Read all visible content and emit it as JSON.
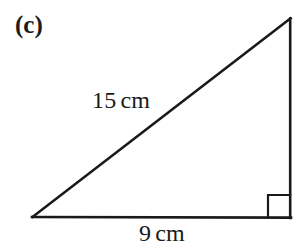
{
  "figure": {
    "part_label": "(c)",
    "background_color": "#ffffff",
    "stroke_color": "#1a1a1a",
    "labels": {
      "hypotenuse": {
        "value": "15",
        "unit": "cm"
      },
      "base": {
        "value": "9",
        "unit": "cm"
      }
    },
    "shape": {
      "type": "right-triangle",
      "vertices": {
        "bottom_left": {
          "x": 32,
          "y": 217
        },
        "bottom_right": {
          "x": 291,
          "y": 218
        },
        "apex": {
          "x": 291,
          "y": 18
        }
      },
      "right_angle_marker": {
        "at": "bottom_right",
        "size": 23
      },
      "stroke_width": 2.6
    }
  }
}
